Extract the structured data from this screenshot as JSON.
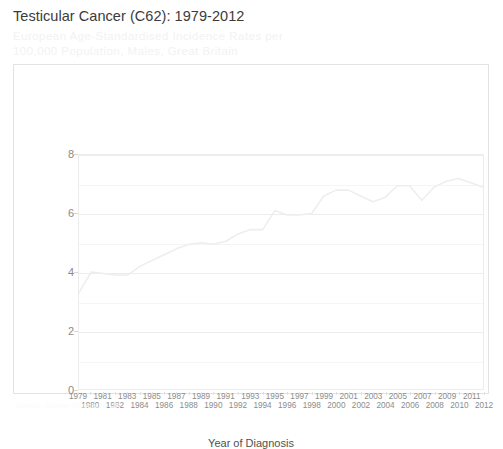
{
  "header": {
    "title": "Testicular Cancer (C62): 1979-2012",
    "subtitle": "European Age-Standardised Incidence Rates per 100,000 Population, Males, Great Britain"
  },
  "footer": {
    "note": "Source: Cancer Research UK"
  },
  "style": {
    "line_color": "#eeeeee",
    "grid_color": "#ededed",
    "panel_border": "#e3e3e3",
    "title_color": "#3b3b3b",
    "subtitle_color": "#f2f2f2",
    "tick_label_color": "#8c8c8c"
  },
  "chart_data": {
    "type": "line",
    "title": "Testicular Cancer (C62): 1979-2012",
    "subtitle": "European Age-Standardised Incidence Rates per 100,000 Population, Males, Great Britain",
    "xlabel": "Year of Diagnosis",
    "ylabel": "Rate per 100,000",
    "ylim": [
      0,
      8
    ],
    "yticks": [
      0,
      2,
      4,
      6,
      8
    ],
    "yticks_minor": [
      1,
      3,
      5,
      7
    ],
    "grid": true,
    "legend": "none",
    "x": [
      1979,
      1980,
      1981,
      1982,
      1983,
      1984,
      1985,
      1986,
      1987,
      1988,
      1989,
      1990,
      1991,
      1992,
      1993,
      1994,
      1995,
      1996,
      1997,
      1998,
      1999,
      2000,
      2001,
      2002,
      2003,
      2004,
      2005,
      2006,
      2007,
      2008,
      2009,
      2010,
      2011,
      2012
    ],
    "categories": [
      "1979",
      "1980",
      "1981",
      "1982",
      "1983",
      "1984",
      "1985",
      "1986",
      "1987",
      "1988",
      "1989",
      "1990",
      "1991",
      "1992",
      "1993",
      "1994",
      "1995",
      "1996",
      "1997",
      "1998",
      "1999",
      "2000",
      "2001",
      "2002",
      "2003",
      "2004",
      "2005",
      "2006",
      "2007",
      "2008",
      "2009",
      "2010",
      "2011",
      "2012"
    ],
    "series": [
      {
        "name": "European Age-Standardised Incidence Rate",
        "values": [
          3.3,
          4.0,
          3.95,
          3.9,
          3.9,
          4.2,
          4.4,
          4.6,
          4.8,
          4.95,
          5.0,
          4.95,
          5.05,
          5.3,
          5.45,
          5.45,
          6.1,
          5.95,
          5.95,
          6.0,
          6.6,
          6.8,
          6.8,
          6.6,
          6.4,
          6.55,
          6.95,
          6.95,
          6.45,
          6.9,
          7.1,
          7.2,
          7.05,
          6.9
        ]
      }
    ]
  }
}
